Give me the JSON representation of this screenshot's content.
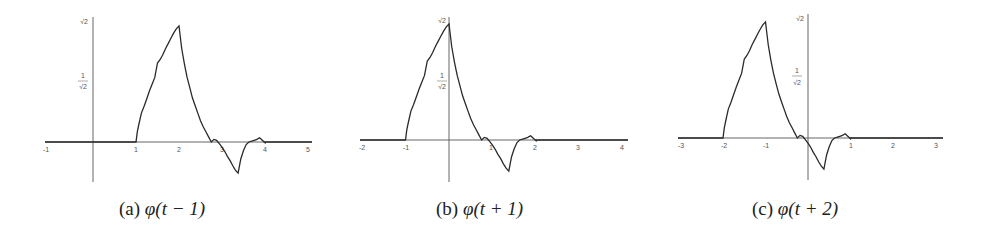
{
  "chart_data": [
    {
      "type": "line",
      "title": "",
      "caption": "(a) φ(t − 1)",
      "shift": 1,
      "xlabel": "",
      "ylabel": "",
      "xlim": [
        -1.1,
        5.1
      ],
      "ylim": [
        -0.55,
        1.45
      ],
      "xticks": [
        -1,
        1,
        2,
        3,
        4,
        5
      ],
      "yticks": [
        {
          "value": 0.7071,
          "label": "1/√2"
        },
        {
          "value": 1.4142,
          "label": "√2"
        }
      ],
      "grid": false,
      "description": "Daubechies D4 scaling function shifted right by 1; support [1,4], peak ≈1.37 at t=2, trough ≈-0.37 at t=3"
    },
    {
      "type": "line",
      "title": "",
      "caption": "(b) φ(t + 1)",
      "shift": -1,
      "xlabel": "",
      "ylabel": "",
      "xlim": [
        -2.1,
        4.1
      ],
      "ylim": [
        -0.55,
        1.45
      ],
      "xticks": [
        -2,
        -1,
        1,
        2,
        3,
        4
      ],
      "yticks": [
        {
          "value": 0.7071,
          "label": "1/√2"
        },
        {
          "value": 1.4142,
          "label": "√2"
        }
      ],
      "grid": false,
      "description": "Daubechies D4 scaling function shifted left by 1; support [-1,2], peak ≈1.37 at t=0, trough ≈-0.37 at t=1"
    },
    {
      "type": "line",
      "title": "",
      "caption": "(c) φ(t + 2)",
      "shift": -2,
      "xlabel": "",
      "ylabel": "",
      "xlim": [
        -3.1,
        3.1
      ],
      "ylim": [
        -0.55,
        1.45
      ],
      "xticks": [
        -3,
        -2,
        -1,
        1,
        2,
        3
      ],
      "yticks": [
        {
          "value": 0.7071,
          "label": "1/√2"
        },
        {
          "value": 1.4142,
          "label": "√2"
        }
      ],
      "grid": false,
      "description": "Daubechies D4 scaling function shifted left by 2; support [-2,1], peak ≈1.37 at t=-1, trough ≈-0.37 at t=0"
    }
  ],
  "base_function": {
    "name": "φ(t)",
    "t": [
      0,
      0.03,
      0.0625,
      0.125,
      0.1875,
      0.25,
      0.3125,
      0.375,
      0.4375,
      0.5,
      0.5625,
      0.625,
      0.6875,
      0.75,
      0.8125,
      0.875,
      0.9375,
      1.0,
      1.0625,
      1.125,
      1.1875,
      1.25,
      1.3125,
      1.375,
      1.4375,
      1.5,
      1.5625,
      1.625,
      1.6875,
      1.75,
      1.8125,
      1.875,
      1.9375,
      2.0,
      2.0625,
      2.125,
      2.1875,
      2.25,
      2.3125,
      2.375,
      2.4375,
      2.5,
      2.5625,
      2.625,
      2.6875,
      2.75,
      2.8125,
      2.875,
      2.9375,
      3.0
    ],
    "y": [
      0,
      0.12,
      0.2,
      0.34,
      0.42,
      0.51,
      0.6,
      0.68,
      0.76,
      0.93,
      0.97,
      1.03,
      1.1,
      1.16,
      1.22,
      1.28,
      1.33,
      1.366,
      1.1,
      0.92,
      0.76,
      0.64,
      0.52,
      0.43,
      0.34,
      0.25,
      0.18,
      0.12,
      0.06,
      0.0,
      0.03,
      0.02,
      -0.02,
      -0.06,
      -0.11,
      -0.17,
      -0.22,
      -0.28,
      -0.33,
      -0.366,
      -0.2,
      -0.1,
      -0.03,
      0.0,
      0.01,
      0.02,
      0.03,
      0.05,
      0.02,
      -0.01
    ]
  },
  "panels": [
    {
      "caption_label": "(a)",
      "caption_func": "φ(t − 1)",
      "y_top_label": "√2",
      "y_mid_label_num": "1",
      "y_mid_label_den": "√2",
      "tick_labels": [
        "-1",
        "1",
        "2",
        "3",
        "4",
        "5"
      ]
    },
    {
      "caption_label": "(b)",
      "caption_func": "φ(t + 1)",
      "y_top_label": "√2",
      "y_mid_label_num": "1",
      "y_mid_label_den": "√2",
      "tick_labels": [
        "-2",
        "-1",
        "1",
        "2",
        "3",
        "4"
      ]
    },
    {
      "caption_label": "(c)",
      "caption_func": "φ(t + 2)",
      "y_top_label": "√2",
      "y_mid_label_num": "1",
      "y_mid_label_den": "√2",
      "tick_labels": [
        "-3",
        "-2",
        "-1",
        "1",
        "2",
        "3"
      ]
    }
  ],
  "colors": {
    "curve": "#2a2a2a",
    "axis": "#555555",
    "text": "#222222"
  }
}
